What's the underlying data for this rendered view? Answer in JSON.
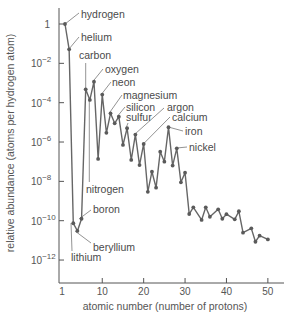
{
  "chart_data": {
    "type": "line",
    "title": "",
    "xlabel": "atomic number (number of protons)",
    "ylabel": "relative abundance (atoms per hydrogen atom)",
    "yscale": "log",
    "xlim": [
      1,
      55
    ],
    "ylim_log10": [
      -13,
      0.8
    ],
    "x_ticks": [
      1,
      10,
      20,
      30,
      40,
      50
    ],
    "x_tick_labels": [
      "1",
      "10",
      "20",
      "30",
      "40",
      "50"
    ],
    "y_ticks_log10": [
      0,
      -2,
      -4,
      -6,
      -8,
      -10,
      -12
    ],
    "y_tick_labels": [
      {
        "base": "1",
        "exp": ""
      },
      {
        "base": "10",
        "exp": "−2"
      },
      {
        "base": "10",
        "exp": "−4"
      },
      {
        "base": "10",
        "exp": "−6"
      },
      {
        "base": "10",
        "exp": "−8"
      },
      {
        "base": "10",
        "exp": "−10"
      },
      {
        "base": "10",
        "exp": "−12"
      }
    ],
    "grid": false,
    "legend": "none",
    "series": [
      {
        "name": "cosmic abundance",
        "x": [
          1,
          2,
          3,
          4,
          5,
          6,
          7,
          8,
          9,
          10,
          11,
          12,
          13,
          14,
          15,
          16,
          17,
          18,
          19,
          20,
          21,
          22,
          23,
          24,
          25,
          26,
          27,
          28,
          29,
          30,
          31,
          32,
          34,
          35,
          36,
          38,
          39,
          40,
          42,
          43,
          44,
          46,
          47,
          48,
          50
        ],
        "log10_values": [
          0,
          -1.29,
          -10.13,
          -10.52,
          -9.9,
          -3.32,
          -3.86,
          -2.93,
          -6.86,
          -3.59,
          -5.53,
          -4.54,
          -5.05,
          -4.71,
          -6.15,
          -5.3,
          -6.91,
          -5.62,
          -7.17,
          -6.1,
          -8.53,
          -7.51,
          -8.32,
          -6.49,
          -7.0,
          -5.25,
          -7.2,
          -6.32,
          -8.05,
          -7.56,
          -9.66,
          -9.32,
          -9.96,
          -9.32,
          -9.8,
          -9.42,
          -9.9,
          -9.67,
          -9.93,
          -9.52,
          -10.61,
          -10.39,
          -11.07,
          -10.76,
          -10.95
        ]
      }
    ],
    "annotations": [
      {
        "text": "hydrogen",
        "z": 1,
        "lx": 81,
        "ly": 18,
        "leader": [
          [
            65,
            24
          ],
          [
            79,
            13
          ]
        ]
      },
      {
        "text": "helium",
        "z": 2,
        "lx": 81,
        "ly": 41,
        "leader": [
          [
            69,
            49
          ],
          [
            79,
            37
          ]
        ]
      },
      {
        "text": "carbon",
        "z": 6,
        "lx": 79,
        "ly": 59,
        "leader": [
          [
            85.7,
            89
          ],
          [
            85.7,
            63
          ]
        ]
      },
      {
        "text": "oxygen",
        "z": 8,
        "lx": 105,
        "ly": 73,
        "leader": [
          [
            93.3,
            81
          ],
          [
            103,
            69
          ]
        ]
      },
      {
        "text": "neon",
        "z": 10,
        "lx": 112,
        "ly": 86,
        "leader": [
          [
            101.7,
            94
          ],
          [
            111,
            82
          ]
        ]
      },
      {
        "text": "magnesium",
        "z": 12,
        "lx": 123,
        "ly": 99,
        "leader": [
          [
            109.3,
            113
          ],
          [
            122,
            95
          ]
        ]
      },
      {
        "text": "silicon",
        "z": 14,
        "lx": 126,
        "ly": 111,
        "leader": [
          [
            117.7,
            116
          ],
          [
            125,
            107
          ]
        ]
      },
      {
        "text": "sulfur",
        "z": 16,
        "lx": 126,
        "ly": 121,
        "leader": [
          [
            126,
            128
          ],
          [
            128,
            123
          ]
        ]
      },
      {
        "text": "argon",
        "z": 18,
        "lx": 167,
        "ly": 111,
        "leader": [
          [
            135,
            134
          ],
          [
            164,
            108
          ]
        ]
      },
      {
        "text": "calcium",
        "z": 20,
        "lx": 172,
        "ly": 121,
        "leader": [
          [
            143.3,
            144
          ],
          [
            170,
            117
          ]
        ]
      },
      {
        "text": "iron",
        "z": 26,
        "lx": 185,
        "ly": 135,
        "leader": [
          [
            168.3,
            127
          ],
          [
            183,
            131
          ]
        ]
      },
      {
        "text": "nickel",
        "z": 28,
        "lx": 189,
        "ly": 151,
        "leader": [
          [
            176.7,
            148
          ],
          [
            187,
            147
          ]
        ]
      },
      {
        "text": "nitrogen",
        "z": 7,
        "lx": 86,
        "ly": 193,
        "leader": [
          [
            89.3,
            100
          ],
          [
            89.3,
            182
          ]
        ]
      },
      {
        "text": "boron",
        "z": 5,
        "lx": 93,
        "ly": 213,
        "leader": [
          [
            79,
            219
          ],
          [
            91,
            210
          ]
        ]
      },
      {
        "text": "beryllium",
        "z": 4,
        "lx": 93,
        "ly": 251,
        "leader": [
          [
            75,
            231
          ],
          [
            91,
            243
          ]
        ]
      },
      {
        "text": "lithium",
        "z": 3,
        "lx": 71,
        "ly": 261,
        "leader": [
          [
            71,
            223
          ],
          [
            72,
            251
          ]
        ]
      }
    ]
  }
}
